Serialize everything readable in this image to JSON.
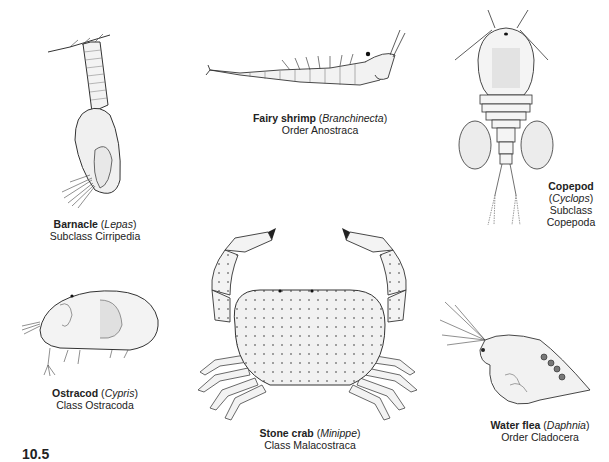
{
  "figure": {
    "number": "10.5",
    "specimens": [
      {
        "id": "barnacle",
        "common_name": "Barnacle",
        "genus": "Lepas",
        "taxon": "Subclass Cirripedia"
      },
      {
        "id": "fairy-shrimp",
        "common_name": "Fairy shrimp",
        "genus": "Branchinecta",
        "taxon": "Order Anostraca"
      },
      {
        "id": "copepod",
        "common_name": "Copepod",
        "genus": "Cyclops",
        "taxon_line1": "Subclass",
        "taxon_line2": "Copepoda"
      },
      {
        "id": "ostracod",
        "common_name": "Ostracod",
        "genus": "Cypris",
        "taxon": "Class Ostracoda"
      },
      {
        "id": "stone-crab",
        "common_name": "Stone crab",
        "genus": "Minippe",
        "taxon": "Class Malacostraca"
      },
      {
        "id": "water-flea",
        "common_name": "Water flea",
        "genus": "Daphnia",
        "taxon": "Order Cladocera"
      }
    ]
  }
}
